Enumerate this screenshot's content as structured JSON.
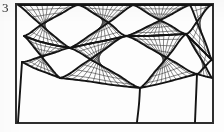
{
  "figure": {
    "label": "3",
    "caption_present": false,
    "frame": {
      "x": 16,
      "y": 4,
      "width": 197,
      "height": 119,
      "stroke": "#2e2e2e",
      "stroke_width": 1.6
    },
    "background_color": "#fdfdfd",
    "ink_color": "#1e1e1e"
  },
  "chart_data": {
    "type": "diagram",
    "subtype": "structured-quadrilateral-surface-mesh",
    "title": "3",
    "xlabel": "",
    "ylabel": "",
    "grid": true,
    "legend": null,
    "style": {
      "block_edge_color": "#141414",
      "block_edge_width": 1.9,
      "grid_line_color": "#3a3a3a",
      "grid_line_width": 0.62,
      "frame_color": "#2e2e2e",
      "frame_width": 1.6
    },
    "axis_ranges": {
      "x": [
        0,
        224
      ],
      "y": [
        0,
        132
      ]
    },
    "blocks": [
      {
        "name": "block-upper-left",
        "corners": [
          [
            18,
            5
          ],
          [
            78,
            5
          ],
          [
            70,
            48
          ],
          [
            24,
            36
          ]
        ],
        "nx": 9,
        "ny": 7,
        "edges": {
          "top": [
            [
              18,
              5
            ],
            [
              36,
              5
            ],
            [
              54,
              5
            ],
            [
              78,
              5
            ]
          ],
          "right": [
            [
              78,
              5
            ],
            [
              76,
              18
            ],
            [
              73,
              32
            ],
            [
              70,
              48
            ]
          ],
          "bottom": [
            [
              70,
              48
            ],
            [
              54,
              45
            ],
            [
              38,
              41
            ],
            [
              24,
              36
            ]
          ],
          "left": [
            [
              24,
              36
            ],
            [
              21,
              26
            ],
            [
              19,
              15
            ],
            [
              18,
              5
            ]
          ]
        }
      },
      {
        "name": "block-upper-center",
        "corners": [
          [
            78,
            5
          ],
          [
            133,
            5
          ],
          [
            126,
            36
          ],
          [
            70,
            48
          ]
        ],
        "nx": 11,
        "ny": 7,
        "edges": {
          "top": [
            [
              78,
              5
            ],
            [
              96,
              5
            ],
            [
              115,
              5
            ],
            [
              133,
              5
            ]
          ],
          "right": [
            [
              133,
              5
            ],
            [
              131,
              16
            ],
            [
              129,
              26
            ],
            [
              126,
              36
            ]
          ],
          "bottom": [
            [
              126,
              36
            ],
            [
              108,
              40
            ],
            [
              88,
              44
            ],
            [
              70,
              48
            ]
          ],
          "left": [
            [
              70,
              48
            ],
            [
              73,
              32
            ],
            [
              76,
              18
            ],
            [
              78,
              5
            ]
          ]
        }
      },
      {
        "name": "block-upper-right",
        "corners": [
          [
            133,
            5
          ],
          [
            190,
            5
          ],
          [
            186,
            34
          ],
          [
            126,
            36
          ]
        ],
        "nx": 11,
        "ny": 7,
        "edges": {
          "top": [
            [
              133,
              5
            ],
            [
              152,
              5
            ],
            [
              171,
              5
            ],
            [
              190,
              5
            ]
          ],
          "right": [
            [
              190,
              5
            ],
            [
              189,
              15
            ],
            [
              188,
              25
            ],
            [
              186,
              34
            ]
          ],
          "bottom": [
            [
              186,
              34
            ],
            [
              166,
              35
            ],
            [
              146,
              36
            ],
            [
              126,
              36
            ]
          ],
          "left": [
            [
              126,
              36
            ],
            [
              129,
              26
            ],
            [
              131,
              16
            ],
            [
              133,
              5
            ]
          ]
        }
      },
      {
        "name": "block-far-right",
        "corners": [
          [
            190,
            5
          ],
          [
            212,
            5
          ],
          [
            212,
            60
          ],
          [
            186,
            34
          ]
        ],
        "nx": 4,
        "ny": 8,
        "edges": {
          "top": [
            [
              190,
              5
            ],
            [
              201,
              5
            ],
            [
              212,
              5
            ]
          ],
          "right": [
            [
              212,
              5
            ],
            [
              212,
              32
            ],
            [
              212,
              60
            ]
          ],
          "bottom": [
            [
              212,
              60
            ],
            [
              199,
              47
            ],
            [
              186,
              34
            ]
          ],
          "left": [
            [
              186,
              34
            ],
            [
              188,
              25
            ],
            [
              189,
              15
            ],
            [
              190,
              5
            ]
          ]
        }
      },
      {
        "name": "block-mid-left",
        "corners": [
          [
            24,
            36
          ],
          [
            70,
            48
          ],
          [
            60,
            78
          ],
          [
            22,
            62
          ]
        ],
        "nx": 8,
        "ny": 7,
        "edges": {
          "top": [
            [
              24,
              36
            ],
            [
              38,
              41
            ],
            [
              54,
              45
            ],
            [
              70,
              48
            ]
          ],
          "right": [
            [
              70,
              48
            ],
            [
              67,
              58
            ],
            [
              64,
              68
            ],
            [
              60,
              78
            ]
          ],
          "bottom": [
            [
              60,
              78
            ],
            [
              47,
              73
            ],
            [
              34,
              68
            ],
            [
              22,
              62
            ]
          ],
          "left": [
            [
              22,
              62
            ],
            [
              22,
              53
            ],
            [
              23,
              44
            ],
            [
              24,
              36
            ]
          ]
        }
      },
      {
        "name": "block-mid-center",
        "corners": [
          [
            70,
            48
          ],
          [
            126,
            36
          ],
          [
            140,
            88
          ],
          [
            60,
            78
          ]
        ],
        "nx": 12,
        "ny": 9,
        "edges": {
          "top": [
            [
              70,
              48
            ],
            [
              88,
              44
            ],
            [
              108,
              40
            ],
            [
              126,
              36
            ]
          ],
          "right": [
            [
              126,
              36
            ],
            [
              131,
              53
            ],
            [
              136,
              71
            ],
            [
              140,
              88
            ]
          ],
          "bottom": [
            [
              140,
              88
            ],
            [
              113,
              85
            ],
            [
              86,
              81
            ],
            [
              60,
              78
            ]
          ],
          "left": [
            [
              60,
              78
            ],
            [
              64,
              68
            ],
            [
              67,
              58
            ],
            [
              70,
              48
            ]
          ]
        }
      },
      {
        "name": "block-mid-right",
        "corners": [
          [
            126,
            36
          ],
          [
            186,
            34
          ],
          [
            197,
            74
          ],
          [
            140,
            88
          ]
        ],
        "nx": 11,
        "ny": 9,
        "edges": {
          "top": [
            [
              126,
              36
            ],
            [
              146,
              36
            ],
            [
              166,
              35
            ],
            [
              186,
              34
            ]
          ],
          "right": [
            [
              186,
              34
            ],
            [
              190,
              48
            ],
            [
              194,
              61
            ],
            [
              197,
              74
            ]
          ],
          "bottom": [
            [
              197,
              74
            ],
            [
              178,
              79
            ],
            [
              159,
              84
            ],
            [
              140,
              88
            ]
          ],
          "left": [
            [
              140,
              88
            ],
            [
              136,
              71
            ],
            [
              131,
              53
            ],
            [
              126,
              36
            ]
          ]
        }
      },
      {
        "name": "block-right-lower",
        "corners": [
          [
            186,
            34
          ],
          [
            212,
            60
          ],
          [
            212,
            78
          ],
          [
            197,
            74
          ]
        ],
        "nx": 4,
        "ny": 4,
        "edges": {
          "top": [
            [
              186,
              34
            ],
            [
              199,
              47
            ],
            [
              212,
              60
            ]
          ],
          "right": [
            [
              212,
              60
            ],
            [
              212,
              69
            ],
            [
              212,
              78
            ]
          ],
          "bottom": [
            [
              212,
              78
            ],
            [
              204,
              76
            ],
            [
              197,
              74
            ]
          ],
          "left": [
            [
              197,
              74
            ],
            [
              194,
              61
            ],
            [
              190,
              48
            ],
            [
              186,
              34
            ]
          ]
        }
      }
    ],
    "free_edges": [
      {
        "name": "edge-lower-left-diagonal",
        "points": [
          [
            22,
            62
          ],
          [
            18,
            122
          ]
        ]
      },
      {
        "name": "edge-lower-center-drop",
        "points": [
          [
            140,
            88
          ],
          [
            139,
            104
          ],
          [
            137,
            122
          ]
        ]
      },
      {
        "name": "edge-lower-right-drop",
        "points": [
          [
            197,
            74
          ],
          [
            196,
            98
          ],
          [
            195,
            122
          ]
        ]
      }
    ],
    "empty_regions": [
      {
        "name": "region-bottom-left",
        "description": "un-meshed background wedge"
      },
      {
        "name": "region-bottom-center",
        "description": "un-meshed background wedge"
      },
      {
        "name": "region-bottom-right",
        "description": "un-meshed background wedge"
      }
    ]
  }
}
